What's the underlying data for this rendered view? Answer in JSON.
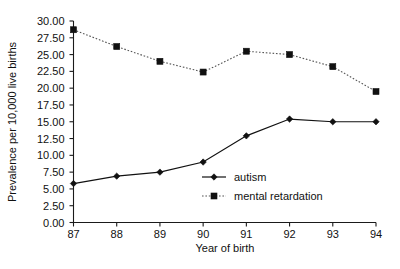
{
  "chart_data": {
    "type": "line",
    "title": "",
    "xlabel": "Year of birth",
    "ylabel": "Prevalence per 10,000 live births",
    "x": [
      "87",
      "88",
      "89",
      "90",
      "91",
      "92",
      "93",
      "94"
    ],
    "categories": [
      "87",
      "88",
      "89",
      "90",
      "91",
      "92",
      "93",
      "94"
    ],
    "xlim": [
      87,
      94
    ],
    "ylim": [
      0.0,
      30.0
    ],
    "ytick_labels": [
      "0.00",
      "2.50",
      "5.00",
      "7.50",
      "10.00",
      "12.50",
      "15.00",
      "17.50",
      "20.00",
      "22.50",
      "25.00",
      "27.50",
      "30.00"
    ],
    "ytick_values": [
      0.0,
      2.5,
      5.0,
      7.5,
      10.0,
      12.5,
      15.0,
      17.5,
      20.0,
      22.5,
      25.0,
      27.5,
      30.0
    ],
    "xtick_labels": [
      "87",
      "88",
      "89",
      "90",
      "91",
      "92",
      "93",
      "94"
    ],
    "grid": false,
    "legend_position": "inside-lower-right",
    "series": [
      {
        "name": "autism",
        "marker": "diamond",
        "linestyle": "solid",
        "color": "#111111",
        "values": [
          5.8,
          6.9,
          7.5,
          9.0,
          12.9,
          15.4,
          15.0,
          15.0
        ]
      },
      {
        "name": "mental retardation",
        "marker": "square",
        "linestyle": "dotted",
        "color": "#111111",
        "values": [
          28.7,
          26.2,
          24.0,
          22.4,
          25.5,
          25.0,
          23.2,
          19.5
        ]
      }
    ]
  },
  "legend": {
    "items": [
      {
        "label": "autism"
      },
      {
        "label": "mental retardation"
      }
    ]
  }
}
